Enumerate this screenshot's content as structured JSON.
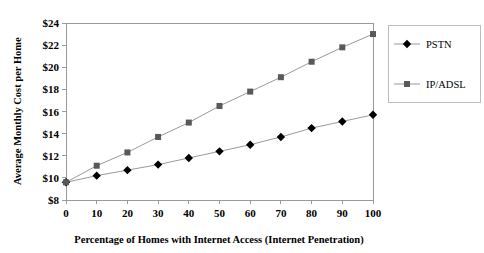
{
  "chart_data": {
    "type": "line",
    "title": "",
    "xlabel": "Percentage of Homes with Internet Access (Internet Penetration)",
    "ylabel": "Average Monthly Cost per Home",
    "x": [
      0,
      10,
      20,
      30,
      40,
      50,
      60,
      70,
      80,
      90,
      100
    ],
    "xticklabels": [
      "0",
      "10",
      "20",
      "30",
      "40",
      "50",
      "60",
      "70",
      "80",
      "90",
      "100"
    ],
    "yticklabels": [
      "$8",
      "$10",
      "$12",
      "$14",
      "$16",
      "$18",
      "$20",
      "$22",
      "$24"
    ],
    "yticks": [
      8,
      10,
      12,
      14,
      16,
      18,
      20,
      22,
      24
    ],
    "xlim": [
      0,
      100
    ],
    "ylim": [
      8,
      24
    ],
    "grid": false,
    "legend_position": "right-outside",
    "series": [
      {
        "name": "PSTN",
        "marker": "diamond",
        "color": "#000000",
        "values": [
          9.6,
          10.2,
          10.7,
          11.2,
          11.8,
          12.4,
          13.0,
          13.7,
          14.5,
          15.1,
          15.7
        ]
      },
      {
        "name": "IP/ADSL",
        "marker": "square",
        "color": "#595959",
        "values": [
          9.6,
          11.1,
          12.3,
          13.7,
          15.0,
          16.5,
          17.8,
          19.1,
          20.5,
          21.8,
          23.0
        ]
      }
    ]
  }
}
